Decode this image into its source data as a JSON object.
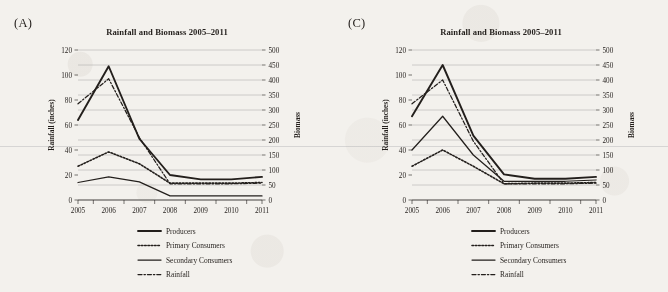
{
  "figure": {
    "background_color": "#f3f1ed",
    "ink_color": "#231f1c",
    "gridline_color": "#9a9a9a"
  },
  "panels": [
    {
      "label": "(A)",
      "title": "Rainfall and Biomass 2005–2011",
      "chart_data": {
        "type": "line",
        "title": "Rainfall and Biomass 2005–2011",
        "xlabel": "",
        "ylabel": "Rainfall (inches)",
        "y2label": "Biomass",
        "categories": [
          "2005",
          "2006",
          "2007",
          "2008",
          "2009",
          "2010",
          "2011"
        ],
        "x": [
          2005,
          2006,
          2007,
          2008,
          2009,
          2010,
          2011
        ],
        "ylim": [
          0,
          120
        ],
        "yticks": [
          0,
          20,
          40,
          60,
          80,
          100,
          120
        ],
        "y2lim": [
          0,
          500
        ],
        "y2ticks": [
          0,
          50,
          100,
          150,
          200,
          250,
          300,
          350,
          400,
          450,
          500
        ],
        "grid": true,
        "legend_position": "bottom",
        "series": [
          {
            "name": "Producers",
            "axis": "right",
            "style": "solid-thick",
            "values_biomass": [
              268,
              447,
              205,
              83,
              69,
              69,
              77
            ],
            "values": [
              64,
              107,
              49,
              20,
              16.5,
              16.5,
              18.5
            ]
          },
          {
            "name": "Primary Consumers",
            "axis": "right",
            "style": "dotted",
            "values_biomass": [
              112,
              160,
              121,
              56,
              56,
              56,
              58
            ],
            "values": [
              27,
              38.5,
              29,
              13.5,
              13.5,
              13.5,
              14
            ]
          },
          {
            "name": "Secondary Consumers",
            "axis": "right",
            "style": "solid-thin",
            "values_biomass": [
              58,
              77,
              60,
              14,
              14,
              14,
              14
            ],
            "values": [
              14,
              18.5,
              14.5,
              3.3,
              3.3,
              3.3,
              3.3
            ]
          },
          {
            "name": "Rainfall",
            "axis": "left",
            "style": "dash-dot",
            "values": [
              77,
              97,
              50,
              13,
              13,
              13,
              13.5
            ]
          }
        ]
      }
    },
    {
      "label": "(C)",
      "title": "Rainfall and Biomass 2005–2011",
      "chart_data": {
        "type": "line",
        "title": "Rainfall and Biomass 2005–2011",
        "xlabel": "",
        "ylabel": "Rainfall (inches)",
        "y2label": "Biomass",
        "categories": [
          "2005",
          "2006",
          "2007",
          "2008",
          "2009",
          "2010",
          "2011"
        ],
        "x": [
          2005,
          2006,
          2007,
          2008,
          2009,
          2010,
          2011
        ],
        "ylim": [
          0,
          120
        ],
        "yticks": [
          0,
          20,
          40,
          60,
          80,
          100,
          120
        ],
        "y2lim": [
          0,
          500
        ],
        "y2ticks": [
          0,
          50,
          100,
          150,
          200,
          250,
          300,
          350,
          400,
          450,
          500
        ],
        "grid": true,
        "legend_position": "bottom",
        "series": [
          {
            "name": "Producers",
            "axis": "right",
            "style": "solid-thick",
            "values_biomass": [
              280,
              450,
              215,
              85,
              70,
              70,
              78
            ],
            "values": [
              67,
              108,
              51.5,
              20.5,
              17,
              17,
              18.5
            ]
          },
          {
            "name": "Primary Consumers",
            "axis": "right",
            "style": "dotted",
            "values_biomass": [
              113,
              167,
              113,
              54,
              57,
              57,
              58
            ],
            "values": [
              27,
              40,
              27,
              13,
              13.5,
              13.5,
              14
            ]
          },
          {
            "name": "Secondary Consumers",
            "axis": "right",
            "style": "solid-thin",
            "values_biomass": [
              167,
              280,
              150,
              62,
              62,
              62,
              67
            ],
            "values": [
              40,
              67,
              36,
              15,
              15,
              15,
              16
            ]
          },
          {
            "name": "Rainfall",
            "axis": "left",
            "style": "dash-dot",
            "values": [
              77,
              96,
              47,
              13,
              13,
              13,
              13.5
            ]
          }
        ]
      }
    }
  ],
  "legend": {
    "items": [
      {
        "label": "Producers",
        "style": "solid-thick"
      },
      {
        "label": "Primary Consumers",
        "style": "dotted"
      },
      {
        "label": "Secondary Consumers",
        "style": "solid-thin"
      },
      {
        "label": "Rainfall",
        "style": "dash-dot"
      }
    ]
  }
}
